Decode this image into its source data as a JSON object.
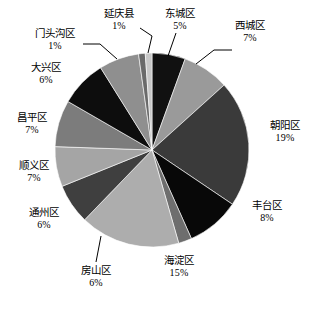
{
  "chart_data": {
    "type": "pie",
    "title": "",
    "subtitle": "",
    "xlabel": "",
    "ylabel": "",
    "legend_position": "labels-outside",
    "grid": false,
    "start_angle_deg": 0,
    "direction": "clockwise",
    "units": "percent",
    "categories": [
      "东城区",
      "西城区",
      "朝阳区",
      "丰台区",
      "石景山区",
      "海淀区",
      "房山区",
      "通州区",
      "顺义区",
      "昌平区",
      "大兴区",
      "门头沟区",
      "延庆县"
    ],
    "values": [
      5,
      7,
      19,
      8,
      2,
      15,
      6,
      6,
      7,
      7,
      6,
      1,
      1
    ],
    "slices": [
      {
        "label": "东城区",
        "percent_text": "5%",
        "value": 5,
        "color": "#111111"
      },
      {
        "label": "西城区",
        "percent_text": "7%",
        "value": 7,
        "color": "#9a9a9a"
      },
      {
        "label": "朝阳区",
        "percent_text": "19%",
        "value": 19,
        "color": "#3a3a3a"
      },
      {
        "label": "丰台区",
        "percent_text": "8%",
        "value": 8,
        "color": "#080808"
      },
      {
        "label": "石景山区",
        "percent_text": "",
        "value": 2,
        "color": "#6e6e6e"
      },
      {
        "label": "海淀区",
        "percent_text": "15%",
        "value": 15,
        "color": "#adadad"
      },
      {
        "label": "房山区",
        "percent_text": "6%",
        "value": 6,
        "color": "#3f3f3f"
      },
      {
        "label": "通州区",
        "percent_text": "6%",
        "value": 6,
        "color": "#a5a5a5"
      },
      {
        "label": "顺义区",
        "percent_text": "7%",
        "value": 7,
        "color": "#7c7c7c"
      },
      {
        "label": "昌平区",
        "percent_text": "7%",
        "value": 7,
        "color": "#0d0d0d"
      },
      {
        "label": "大兴区",
        "percent_text": "6%",
        "value": 6,
        "color": "#8f8f8f"
      },
      {
        "label": "门头沟区",
        "percent_text": "1%",
        "value": 1,
        "color": "#6a6a6a"
      },
      {
        "label": "延庆县",
        "percent_text": "1%",
        "value": 1,
        "color": "#c8c8c8"
      }
    ]
  },
  "labels": {
    "dongcheng": {
      "name": "东城区",
      "pct": "5%"
    },
    "xicheng": {
      "name": "西城区",
      "pct": "7%"
    },
    "chaoyang": {
      "name": "朝阳区",
      "pct": "19%"
    },
    "fengtai": {
      "name": "丰台区",
      "pct": "8%"
    },
    "haidian": {
      "name": "海淀区",
      "pct": "15%"
    },
    "fangshan": {
      "name": "房山区",
      "pct": "6%"
    },
    "tongzhou": {
      "name": "通州区",
      "pct": "6%"
    },
    "shunyi": {
      "name": "顺义区",
      "pct": "7%"
    },
    "changping": {
      "name": "昌平区",
      "pct": "7%"
    },
    "daxing": {
      "name": "大兴区",
      "pct": "6%"
    },
    "mentougou": {
      "name": "门头沟区",
      "pct": "1%"
    },
    "yanqing": {
      "name": "延庆县",
      "pct": "1%"
    }
  }
}
